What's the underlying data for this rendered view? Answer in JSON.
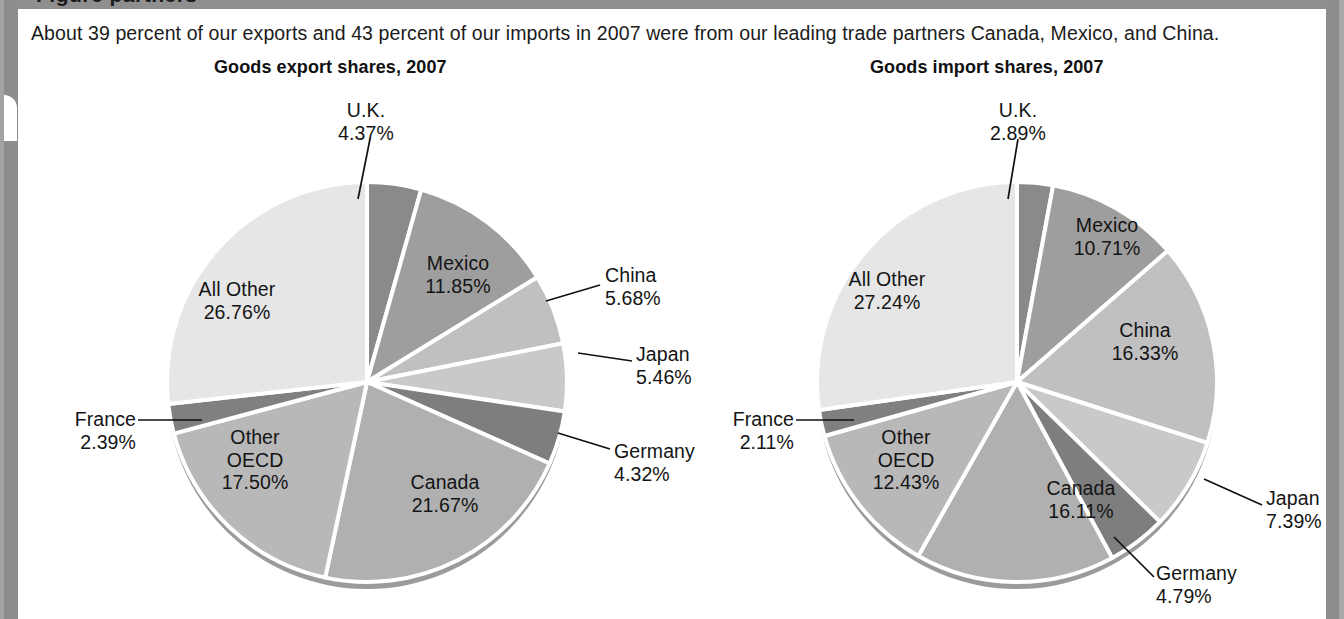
{
  "figure": {
    "top_cropped_caption": "Figure    partners",
    "intro": "About 39 percent of our exports and 43 percent of our imports in 2007 were from our leading trade partners Canada, Mexico, and China."
  },
  "palette": {
    "uk": "#8a8a8a",
    "mexico": "#9e9e9e",
    "china": "#c0c0c0",
    "japan": "#c9c9c9",
    "germany": "#7e7e7e",
    "canada": "#b0b0b0",
    "other_oecd": "#b8b8b8",
    "france": "#808080",
    "all_other": "#e6e6e6",
    "separator": "#ffffff",
    "rim": "#9b9b9b",
    "text": "#141414",
    "panel_bg": "#ffffff",
    "page_bg": "#9a9a9a"
  },
  "chart_data": [
    {
      "type": "pie",
      "id": "goods-export-shares-2007",
      "title": "Goods export shares, 2007",
      "categories": [
        "U.K.",
        "Mexico",
        "China",
        "Japan",
        "Germany",
        "Canada",
        "Other OECD",
        "France",
        "All Other"
      ],
      "values": [
        4.37,
        11.85,
        5.68,
        5.46,
        4.32,
        21.67,
        17.5,
        2.39,
        26.76
      ],
      "value_labels": [
        "4.37%",
        "11.85%",
        "5.68%",
        "5.46%",
        "4.32%",
        "21.67%",
        "17.50%",
        "2.39%",
        "26.76%"
      ],
      "start_angle_deg": 0,
      "direction": "clockwise",
      "legend": "none",
      "labels": [
        {
          "name": "U.K.",
          "value": "4.37%",
          "placement": "outside-leader"
        },
        {
          "name": "Mexico",
          "value": "11.85%",
          "placement": "inside"
        },
        {
          "name": "China",
          "value": "5.68%",
          "placement": "outside-leader"
        },
        {
          "name": "Japan",
          "value": "5.46%",
          "placement": "outside-leader"
        },
        {
          "name": "Germany",
          "value": "4.32%",
          "placement": "outside-leader"
        },
        {
          "name": "Canada",
          "value": "21.67%",
          "placement": "inside"
        },
        {
          "name": "Other OECD",
          "value": "17.50%",
          "placement": "inside"
        },
        {
          "name": "France",
          "value": "2.39%",
          "placement": "outside-leader"
        },
        {
          "name": "All Other",
          "value": "26.76%",
          "placement": "inside"
        }
      ]
    },
    {
      "type": "pie",
      "id": "goods-import-shares-2007",
      "title": "Goods import shares, 2007",
      "categories": [
        "U.K.",
        "Mexico",
        "China",
        "Japan",
        "Germany",
        "Canada",
        "Other OECD",
        "France",
        "All Other"
      ],
      "values": [
        2.89,
        10.71,
        16.33,
        7.39,
        4.79,
        16.11,
        12.43,
        2.11,
        27.24
      ],
      "value_labels": [
        "2.89%",
        "10.71%",
        "16.33%",
        "7.39%",
        "4.79%",
        "16.11%",
        "12.43%",
        "2.11%",
        "27.24%"
      ],
      "start_angle_deg": 0,
      "direction": "clockwise",
      "legend": "none",
      "labels": [
        {
          "name": "U.K.",
          "value": "2.89%",
          "placement": "outside-leader"
        },
        {
          "name": "Mexico",
          "value": "10.71%",
          "placement": "inside"
        },
        {
          "name": "China",
          "value": "16.33%",
          "placement": "inside"
        },
        {
          "name": "Japan",
          "value": "7.39%",
          "placement": "outside-leader"
        },
        {
          "name": "Germany",
          "value": "4.79%",
          "placement": "outside-leader"
        },
        {
          "name": "Canada",
          "value": "16.11%",
          "placement": "inside"
        },
        {
          "name": "Other OECD",
          "value": "12.43%",
          "placement": "inside"
        },
        {
          "name": "France",
          "value": "2.11%",
          "placement": "outside-leader"
        },
        {
          "name": "All Other",
          "value": "27.24%",
          "placement": "inside"
        }
      ]
    }
  ],
  "left_chart": {
    "title": "Goods export shares, 2007",
    "uk_name": "U.K.",
    "uk_val": "4.37%",
    "mexico_name": "Mexico",
    "mexico_val": "11.85%",
    "china_name": "China",
    "china_val": "5.68%",
    "japan_name": "Japan",
    "japan_val": "5.46%",
    "germany_name": "Germany",
    "germany_val": "4.32%",
    "canada_name": "Canada",
    "canada_val": "21.67%",
    "oecd_name1": "Other",
    "oecd_name2": "OECD",
    "oecd_val": "17.50%",
    "france_name": "France",
    "france_val": "2.39%",
    "allother_name": "All Other",
    "allother_val": "26.76%"
  },
  "right_chart": {
    "title": "Goods import shares, 2007",
    "uk_name": "U.K.",
    "uk_val": "2.89%",
    "mexico_name": "Mexico",
    "mexico_val": "10.71%",
    "china_name": "China",
    "china_val": "16.33%",
    "japan_name": "Japan",
    "japan_val": "7.39%",
    "germany_name": "Germany",
    "germany_val": "4.79%",
    "canada_name": "Canada",
    "canada_val": "16.11%",
    "oecd_name1": "Other",
    "oecd_name2": "OECD",
    "oecd_val": "12.43%",
    "france_name": "France",
    "france_val": "2.11%",
    "allother_name": "All Other",
    "allother_val": "27.24%"
  }
}
